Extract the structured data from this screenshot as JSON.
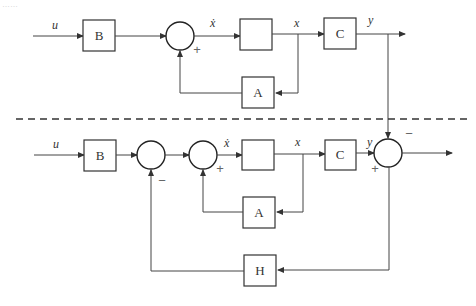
{
  "header_fragment": "……",
  "top_diagram": {
    "input_label": "u",
    "blocks": {
      "b": "B",
      "integrator": "",
      "c": "C",
      "a": "A"
    },
    "signals": {
      "xdot": "ẋ",
      "x": "x",
      "y": "y"
    },
    "sum_signs": {
      "feedback": "+"
    }
  },
  "bottom_diagram": {
    "input_label": "u",
    "blocks": {
      "b": "B",
      "integrator": "",
      "c": "C",
      "a": "A",
      "h": "H"
    },
    "signals": {
      "xdot": "ẋ",
      "x": "x",
      "y": "y"
    },
    "sum_signs": {
      "sum1_feedback": "−",
      "sum2_feedback": "+",
      "sum3_top": "−",
      "sum3_left": "+"
    }
  },
  "colors": {
    "line": "#444444",
    "block_border": "#333333",
    "sign": "#666666"
  }
}
